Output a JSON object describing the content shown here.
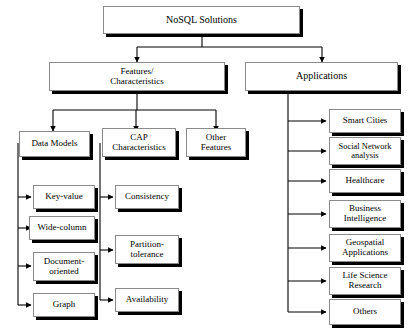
{
  "diagram": {
    "background_color": "#ffffff",
    "line_color": "#000000",
    "box_fill": "#ffffff",
    "box_border_color": "#8a8a8a",
    "box_shadow_color": "#000000",
    "root": {
      "label": "NoSQL Solutions"
    },
    "branches": {
      "features": {
        "label": "Features/\nCharacteristics"
      },
      "applications": {
        "label": "Applications"
      }
    },
    "feature_categories": [
      {
        "label": "Data Models"
      },
      {
        "label": "CAP\nCharacteristics"
      },
      {
        "label": "Other\nFeatures"
      }
    ],
    "data_models": [
      {
        "label": "Key-value"
      },
      {
        "label": "Wide-column"
      },
      {
        "label": "Document-\noriented"
      },
      {
        "label": "Graph"
      }
    ],
    "cap_characteristics": [
      {
        "label": "Consistency"
      },
      {
        "label": "Partition-\ntolerance"
      },
      {
        "label": "Availability"
      }
    ],
    "applications": [
      {
        "label": "Smart Cities"
      },
      {
        "label": "Social Network\nanalysis"
      },
      {
        "label": "Healthcare"
      },
      {
        "label": "Business\nIntelligence"
      },
      {
        "label": "Geospatial\nApplications"
      },
      {
        "label": "Life Science\nResearch"
      },
      {
        "label": "Others"
      }
    ]
  }
}
